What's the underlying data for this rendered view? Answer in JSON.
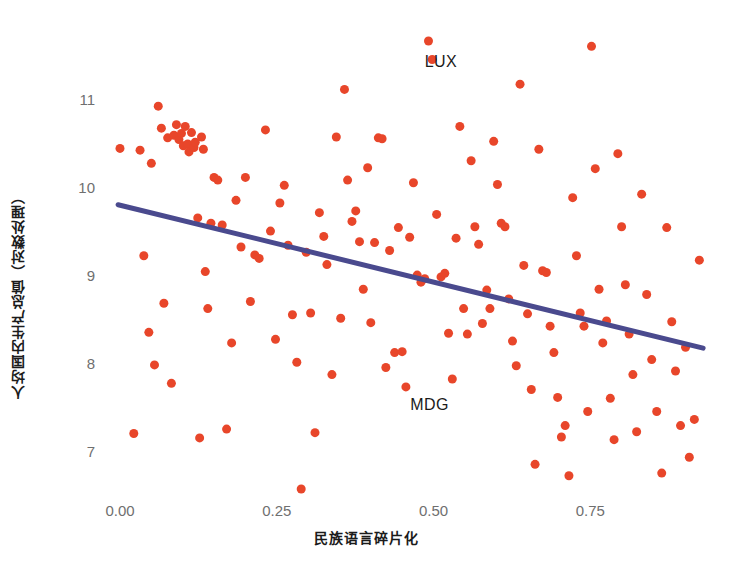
{
  "chart_data": {
    "type": "scatter",
    "title": "",
    "xlabel": "民族语言碎片化",
    "ylabel": "人均国内生产总值（对数处理）",
    "xlim": [
      -0.035,
      0.945
    ],
    "ylim": [
      6.45,
      11.75
    ],
    "xticks": [
      0.0,
      0.25,
      0.5,
      0.75
    ],
    "xticklabels": [
      "0.00",
      "0.25",
      "0.50",
      "0.75"
    ],
    "yticks": [
      7,
      8,
      9,
      10,
      11
    ],
    "yticklabels": [
      "7",
      "8",
      "9",
      "10",
      "11"
    ],
    "grid": false,
    "legend": null,
    "point_color": "#E8462A",
    "point_size": 9,
    "annotations": [
      {
        "text": "LUX",
        "x": 0.521,
        "y": 11.43
      },
      {
        "text": "MDG",
        "x": 0.498,
        "y": 7.53
      }
    ],
    "trend_line": {
      "type": "linear_fit",
      "color": "#4A4A8E",
      "width": 5,
      "x_start": -0.003,
      "y_start": 9.81,
      "x_end": 0.93,
      "y_end": 8.18
    },
    "series": [
      {
        "name": "国家",
        "color": "#E8462A",
        "points": [
          [
            0.0,
            10.45
          ],
          [
            0.022,
            7.21
          ],
          [
            0.032,
            10.43
          ],
          [
            0.038,
            9.23
          ],
          [
            0.046,
            8.36
          ],
          [
            0.05,
            10.28
          ],
          [
            0.055,
            7.99
          ],
          [
            0.061,
            10.93
          ],
          [
            0.066,
            10.68
          ],
          [
            0.07,
            8.69
          ],
          [
            0.076,
            10.57
          ],
          [
            0.082,
            7.78
          ],
          [
            0.086,
            10.6
          ],
          [
            0.09,
            10.72
          ],
          [
            0.094,
            10.55
          ],
          [
            0.098,
            10.62
          ],
          [
            0.101,
            10.48
          ],
          [
            0.104,
            10.7
          ],
          [
            0.108,
            10.5
          ],
          [
            0.11,
            10.41
          ],
          [
            0.114,
            10.63
          ],
          [
            0.118,
            10.46
          ],
          [
            0.12,
            10.52
          ],
          [
            0.124,
            9.66
          ],
          [
            0.127,
            7.16
          ],
          [
            0.13,
            10.58
          ],
          [
            0.133,
            10.44
          ],
          [
            0.136,
            9.05
          ],
          [
            0.14,
            8.63
          ],
          [
            0.145,
            9.6
          ],
          [
            0.15,
            10.12
          ],
          [
            0.156,
            10.09
          ],
          [
            0.163,
            9.58
          ],
          [
            0.17,
            7.26
          ],
          [
            0.178,
            8.24
          ],
          [
            0.185,
            9.86
          ],
          [
            0.193,
            9.33
          ],
          [
            0.2,
            10.12
          ],
          [
            0.208,
            8.71
          ],
          [
            0.215,
            9.24
          ],
          [
            0.222,
            9.2
          ],
          [
            0.232,
            10.66
          ],
          [
            0.24,
            9.51
          ],
          [
            0.248,
            8.28
          ],
          [
            0.255,
            9.83
          ],
          [
            0.262,
            10.03
          ],
          [
            0.268,
            9.35
          ],
          [
            0.275,
            8.56
          ],
          [
            0.282,
            8.02
          ],
          [
            0.289,
            6.58
          ],
          [
            0.297,
            9.27
          ],
          [
            0.304,
            8.58
          ],
          [
            0.311,
            7.22
          ],
          [
            0.318,
            9.72
          ],
          [
            0.325,
            9.45
          ],
          [
            0.33,
            9.13
          ],
          [
            0.338,
            7.88
          ],
          [
            0.345,
            10.58
          ],
          [
            0.352,
            8.52
          ],
          [
            0.358,
            11.12
          ],
          [
            0.363,
            10.09
          ],
          [
            0.37,
            9.62
          ],
          [
            0.376,
            9.74
          ],
          [
            0.382,
            9.39
          ],
          [
            0.388,
            8.85
          ],
          [
            0.395,
            10.23
          ],
          [
            0.4,
            8.47
          ],
          [
            0.406,
            9.38
          ],
          [
            0.412,
            10.57
          ],
          [
            0.418,
            10.56
          ],
          [
            0.424,
            7.96
          ],
          [
            0.43,
            9.29
          ],
          [
            0.438,
            8.13
          ],
          [
            0.444,
            9.55
          ],
          [
            0.45,
            8.14
          ],
          [
            0.456,
            7.74
          ],
          [
            0.462,
            9.44
          ],
          [
            0.468,
            10.06
          ],
          [
            0.474,
            9.01
          ],
          [
            0.48,
            8.93
          ],
          [
            0.486,
            8.97
          ],
          [
            0.492,
            11.67
          ],
          [
            0.498,
            11.46
          ],
          [
            0.505,
            9.7
          ],
          [
            0.512,
            8.99
          ],
          [
            0.518,
            9.03
          ],
          [
            0.524,
            8.35
          ],
          [
            0.53,
            7.83
          ],
          [
            0.536,
            9.43
          ],
          [
            0.542,
            10.7
          ],
          [
            0.548,
            8.63
          ],
          [
            0.554,
            8.34
          ],
          [
            0.56,
            10.31
          ],
          [
            0.566,
            9.56
          ],
          [
            0.572,
            9.36
          ],
          [
            0.578,
            8.46
          ],
          [
            0.585,
            8.84
          ],
          [
            0.59,
            8.63
          ],
          [
            0.596,
            10.53
          ],
          [
            0.602,
            10.04
          ],
          [
            0.608,
            9.6
          ],
          [
            0.614,
            9.56
          ],
          [
            0.62,
            8.74
          ],
          [
            0.626,
            8.26
          ],
          [
            0.632,
            7.98
          ],
          [
            0.638,
            11.18
          ],
          [
            0.644,
            9.12
          ],
          [
            0.65,
            8.57
          ],
          [
            0.656,
            7.71
          ],
          [
            0.662,
            6.86
          ],
          [
            0.668,
            10.44
          ],
          [
            0.674,
            9.06
          ],
          [
            0.68,
            9.04
          ],
          [
            0.686,
            8.43
          ],
          [
            0.692,
            8.13
          ],
          [
            0.698,
            7.62
          ],
          [
            0.704,
            7.17
          ],
          [
            0.71,
            7.3
          ],
          [
            0.716,
            6.73
          ],
          [
            0.722,
            9.89
          ],
          [
            0.728,
            9.23
          ],
          [
            0.734,
            8.58
          ],
          [
            0.74,
            8.43
          ],
          [
            0.746,
            7.46
          ],
          [
            0.752,
            11.61
          ],
          [
            0.758,
            10.22
          ],
          [
            0.764,
            8.85
          ],
          [
            0.77,
            8.24
          ],
          [
            0.776,
            8.49
          ],
          [
            0.782,
            7.61
          ],
          [
            0.788,
            7.14
          ],
          [
            0.794,
            10.39
          ],
          [
            0.8,
            9.56
          ],
          [
            0.806,
            8.9
          ],
          [
            0.812,
            8.34
          ],
          [
            0.818,
            7.88
          ],
          [
            0.824,
            7.23
          ],
          [
            0.832,
            9.93
          ],
          [
            0.84,
            8.79
          ],
          [
            0.848,
            8.05
          ],
          [
            0.856,
            7.46
          ],
          [
            0.864,
            6.76
          ],
          [
            0.872,
            9.55
          ],
          [
            0.88,
            8.48
          ],
          [
            0.886,
            7.92
          ],
          [
            0.894,
            7.3
          ],
          [
            0.902,
            8.19
          ],
          [
            0.908,
            6.94
          ],
          [
            0.916,
            7.37
          ],
          [
            0.924,
            9.18
          ]
        ]
      }
    ]
  },
  "axis": {
    "y_title": "人均国内生产总值（对数处理）",
    "x_title": "民族语言碎片化"
  },
  "caption": ""
}
